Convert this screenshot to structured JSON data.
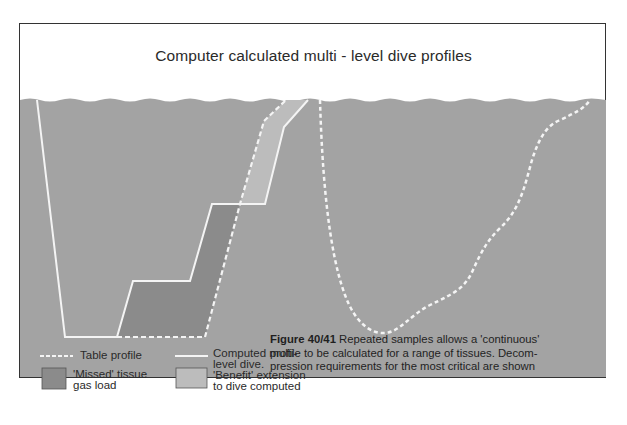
{
  "title": "Computer calculated multi - level dive profiles",
  "colors": {
    "water": "#a3a3a3",
    "missed_fill": "#8b8b8b",
    "benefit_fill": "#bcbcbc",
    "line": "#f4f4f4",
    "frame": "#333333"
  },
  "profiles": {
    "computed_dive": "Computed multi-level dive (solid line)",
    "table_profile": "Table profile (dashed line)",
    "continuous_profile": "Continuous tissue profile (dashed curve)"
  },
  "legend": [
    {
      "key": "table-profile",
      "symbol": "dashed-line",
      "label": "Table profile"
    },
    {
      "key": "computed-dive",
      "symbol": "solid-line",
      "label_line1": "Computed multi-",
      "label_line2": "level dive."
    },
    {
      "key": "missed-tissue",
      "symbol": "dark-box",
      "label_line1": "'Missed' tissue",
      "label_line2": "gas load"
    },
    {
      "key": "benefit-extension",
      "symbol": "light-box",
      "label_line1": "'Benefit' extension",
      "label_line2": "to dive computed"
    }
  ],
  "caption": {
    "figure_label": "Figure 40/41",
    "line1": " Repeated samples allows a 'continuous'",
    "line2": "profile to be calculated for a range of tissues. Decom-",
    "line3": "pression requirements for the most critical are shown"
  }
}
